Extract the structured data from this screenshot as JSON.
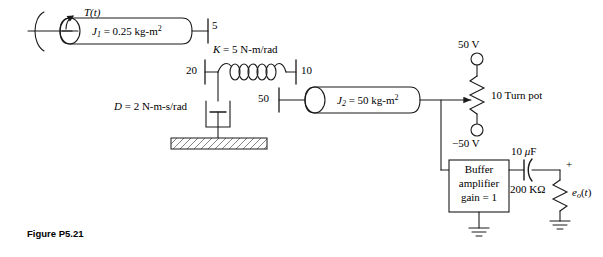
{
  "figure": {
    "caption": "Figure P5.21"
  },
  "mechanical": {
    "torque_source": {
      "label": "T(t)",
      "icon": "curved-torque-arrow-icon"
    },
    "inertia_1": {
      "symbol": "J",
      "subscript": "1",
      "value": "= 0.25 kg-m",
      "exponent": "2",
      "full": "J1 = 0.25 kg-m2"
    },
    "inertia_2": {
      "symbol": "J",
      "subscript": "2",
      "value": "= 50 kg-m",
      "exponent": "2",
      "full": "J2 = 50 kg-m2"
    },
    "gears": [
      {
        "name": "gear-5",
        "teeth": "5"
      },
      {
        "name": "gear-20",
        "teeth": "20"
      },
      {
        "name": "gear-10-upper",
        "teeth": "10"
      },
      {
        "name": "gear-50",
        "teeth": "50"
      }
    ],
    "spring": {
      "label_k": "K",
      "label_value": "= 5 N-m/rad",
      "full": "K = 5 N-m/rad"
    },
    "damper": {
      "label_d": "D",
      "label_value": "= 2 N-m-s/rad",
      "full": "D = 2 N-m-s/rad"
    }
  },
  "electrical": {
    "supply_positive": "50 V",
    "supply_negative": "−50 V",
    "potentiometer": {
      "turns": "10",
      "label": "Turn pot",
      "full": "10  Turn pot"
    },
    "buffer": {
      "line1": "Buffer",
      "line2": "amplifier",
      "line3": "gain = 1"
    },
    "capacitor": {
      "value": "10",
      "unit": "μF",
      "full": "10 μF"
    },
    "resistor": {
      "full": "200 KΩ"
    },
    "output": {
      "symbol": "e",
      "subscript": "o",
      "arg": "(t)",
      "polarity_plus": "+",
      "full": "eo(t)"
    }
  },
  "colors": {
    "stroke": "#1a1a1a",
    "background": "#ffffff",
    "hatch": "#555555"
  }
}
